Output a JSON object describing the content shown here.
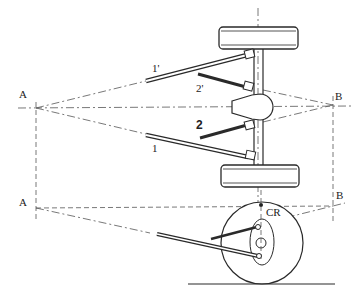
{
  "diagram": {
    "title": "",
    "type": "suspension-geometry",
    "top_view": {
      "labels": {
        "point_a": "A",
        "point_b": "B",
        "link_1": "1",
        "link_1_prime": "1'",
        "link_2": "2",
        "link_2_prime": "2'"
      }
    },
    "side_view": {
      "labels": {
        "point_a": "A",
        "point_b": "B",
        "roll_center": "CR"
      }
    },
    "colors": {
      "ink": "#2a2a2a",
      "background": "#ffffff"
    }
  }
}
